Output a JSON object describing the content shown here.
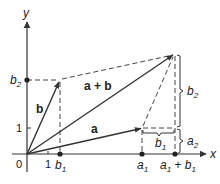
{
  "diagram": {
    "axes": {
      "x_label": "x",
      "y_label": "y",
      "origin_label": "0",
      "x_tick_label": "1",
      "y_tick_label": "1"
    },
    "vectors": {
      "a": {
        "label": "a",
        "tail": [
          0,
          0
        ],
        "head": [
          "a1",
          "a2"
        ]
      },
      "b": {
        "label": "b",
        "tail": [
          0,
          0
        ],
        "head": [
          "b1",
          "b2"
        ]
      },
      "sum": {
        "label": "a + b",
        "tail": [
          0,
          0
        ],
        "head": [
          "a1 + b1",
          "a2 + b2"
        ]
      }
    },
    "axis_point_labels": {
      "b1": "b",
      "b1_sub": "1",
      "a1": "a",
      "a1_sub": "1",
      "a1b1_a": "a",
      "a1b1_a_sub": "1",
      "a1b1_plus": " + ",
      "a1b1_b": "b",
      "a1b1_b_sub": "1",
      "b2": "b",
      "b2_sub": "2"
    },
    "brace_labels": {
      "b1": "b",
      "b1_sub": "1",
      "a2": "a",
      "a2_sub": "2",
      "b2": "b",
      "b2_sub": "2"
    },
    "colors": {
      "line": "#333333",
      "background": "#ffffff"
    }
  }
}
